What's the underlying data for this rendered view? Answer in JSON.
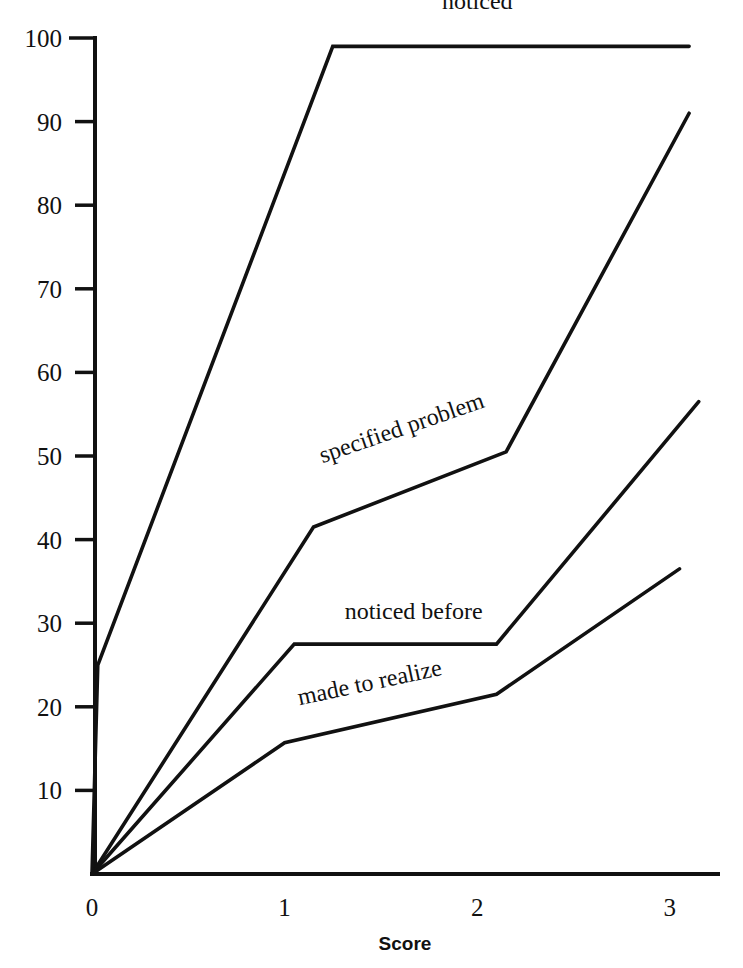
{
  "chart_data": {
    "type": "line",
    "title": "",
    "subtitle": "",
    "xlabel": "Score",
    "ylabel": "",
    "xlim": [
      0,
      3.25
    ],
    "ylim": [
      0,
      100
    ],
    "grid": false,
    "legend_position": "inline-labels",
    "x_ticks": [
      0,
      1,
      2,
      3
    ],
    "x_tick_labels": [
      "0",
      "1",
      "2",
      "3"
    ],
    "y_ticks": [
      10,
      20,
      30,
      40,
      50,
      60,
      70,
      80,
      90,
      100
    ],
    "y_tick_labels": [
      "10",
      "20",
      "30",
      "40",
      "50",
      "60",
      "70",
      "80",
      "90",
      "100"
    ],
    "line_color": "#111111",
    "series": [
      {
        "name": "noticed",
        "label": "noticed",
        "label_rotation": 0,
        "label_x": 2.0,
        "label_y": 103.5,
        "points": [
          {
            "x": 0.0,
            "y": 0.0
          },
          {
            "x": 0.03,
            "y": 25.0
          },
          {
            "x": 1.25,
            "y": 99.0
          },
          {
            "x": 3.1,
            "y": 99.0
          }
        ]
      },
      {
        "name": "specified problem",
        "label": "specified problem",
        "label_rotation": -19,
        "label_x": 1.62,
        "label_y": 52.5,
        "points": [
          {
            "x": 0.0,
            "y": 0.0
          },
          {
            "x": 1.15,
            "y": 41.5
          },
          {
            "x": 2.15,
            "y": 50.5
          },
          {
            "x": 3.1,
            "y": 91.0
          }
        ]
      },
      {
        "name": "noticed before",
        "label": "noticed before",
        "label_rotation": 0,
        "label_x": 1.67,
        "label_y": 30.5,
        "points": [
          {
            "x": 0.0,
            "y": 0.0
          },
          {
            "x": 1.05,
            "y": 27.5
          },
          {
            "x": 2.1,
            "y": 27.5
          },
          {
            "x": 3.15,
            "y": 56.5
          }
        ]
      },
      {
        "name": "made to realize",
        "label": "made to realize",
        "label_rotation": -12,
        "label_x": 1.45,
        "label_y": 22.0,
        "points": [
          {
            "x": 0.0,
            "y": 0.0
          },
          {
            "x": 1.0,
            "y": 15.7
          },
          {
            "x": 2.1,
            "y": 21.5
          },
          {
            "x": 3.05,
            "y": 36.5
          }
        ]
      }
    ]
  }
}
